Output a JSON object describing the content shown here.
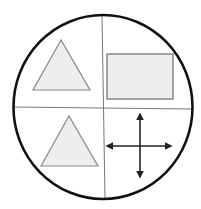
{
  "diagram": {
    "title": "",
    "colors": {
      "background": "#ffffff",
      "circle_stroke": "#111111",
      "divider_stroke": "#777777",
      "shape_fill": "#eeeeee",
      "shape_stroke": "#888888",
      "arrow_stroke": "#222222"
    },
    "circle": {
      "cx": 103,
      "cy": 107,
      "rx": 89.5,
      "ry": 92
    },
    "dividers": {
      "vertical": {
        "x1": 102,
        "y1": 15,
        "x2": 105,
        "y2": 199
      },
      "horizontal": {
        "x1": 13,
        "y1": 107,
        "x2": 192,
        "y2": 109
      }
    },
    "quadrants": [
      {
        "position": "top-left",
        "shape": "triangle",
        "points": "61,40 33,90 90,90"
      },
      {
        "position": "top-right",
        "shape": "rectangle",
        "x": 107,
        "y": 54,
        "width": 66,
        "height": 45
      },
      {
        "position": "bottom-left",
        "shape": "triangle",
        "points": "69,116 41,166 98,166"
      },
      {
        "position": "bottom-right",
        "shape": "four-way-arrow",
        "cx": 140,
        "cy": 146,
        "h": {
          "x1": 107,
          "x2": 171
        },
        "v": {
          "y1": 114,
          "y2": 177
        }
      }
    ]
  }
}
